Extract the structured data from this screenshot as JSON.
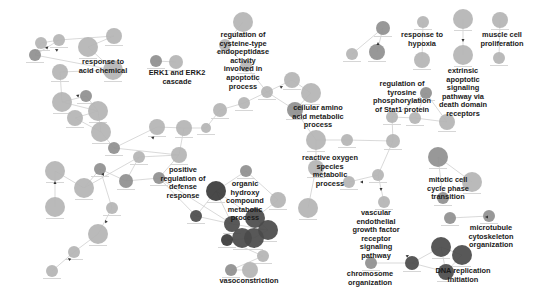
{
  "diagram": {
    "title": "",
    "colors": {
      "node_light": "#b4b4b4",
      "node_mid": "#8f8f8f",
      "node_dark": "#4a4a4a",
      "node_darker": "#3a3a3a",
      "edge": "#cfcfcf",
      "label": "#1a1a1a"
    },
    "cluster_labels": [
      {
        "id": "c1",
        "lines": [
          "response to",
          "acid chemical"
        ],
        "x": 103,
        "y": 64
      },
      {
        "id": "c2",
        "lines": [
          "ERK1 and ERK2",
          "cascade"
        ],
        "x": 177,
        "y": 75
      },
      {
        "id": "c3",
        "lines": [
          "regulation of",
          "cysteine-type",
          "endopeptidase",
          "activity",
          "involved in",
          "apoptotic",
          "process"
        ],
        "x": 243,
        "y": 37
      },
      {
        "id": "c4",
        "lines": [
          "cellular amino",
          "acid metabolic",
          "process"
        ],
        "x": 318,
        "y": 110
      },
      {
        "id": "c5",
        "lines": [
          "regulation of",
          "tyrosine",
          "phosphorylation",
          "of Stat1 protein"
        ],
        "x": 402,
        "y": 86
      },
      {
        "id": "c6",
        "lines": [
          "response to",
          "hypoxia"
        ],
        "x": 422,
        "y": 37
      },
      {
        "id": "c7",
        "lines": [
          "muscle cell",
          "proliferation"
        ],
        "x": 502,
        "y": 37
      },
      {
        "id": "c8",
        "lines": [
          "extrinsic",
          "apoptotic",
          "signaling",
          "pathway via",
          "death domain",
          "receptors"
        ],
        "x": 463,
        "y": 73
      },
      {
        "id": "c9",
        "lines": [
          "positive",
          "regulation of",
          "defense",
          "response"
        ],
        "x": 183,
        "y": 172
      },
      {
        "id": "c10",
        "lines": [
          "organic",
          "hydroxy",
          "compound",
          "metabolic",
          "process"
        ],
        "x": 245,
        "y": 186
      },
      {
        "id": "c11",
        "lines": [
          "reactive oxygen",
          "species",
          "metabolic",
          "process"
        ],
        "x": 330,
        "y": 160
      },
      {
        "id": "c12",
        "lines": [
          "mitotic cell",
          "cycle phase",
          "transition"
        ],
        "x": 448,
        "y": 182
      },
      {
        "id": "c13",
        "lines": [
          "vascular",
          "endothelial",
          "growth factor",
          "receptor",
          "signaling",
          "pathway"
        ],
        "x": 376,
        "y": 215
      },
      {
        "id": "c14",
        "lines": [
          "microtubule",
          "cytoskeleton",
          "organization"
        ],
        "x": 491,
        "y": 230
      },
      {
        "id": "c15",
        "lines": [
          "chromosome",
          "organization"
        ],
        "x": 370,
        "y": 276
      },
      {
        "id": "c16",
        "lines": [
          "DNA replication",
          "initiation"
        ],
        "x": 463,
        "y": 273
      },
      {
        "id": "c17",
        "lines": [
          "vasoconstriction"
        ],
        "x": 249,
        "y": 283
      }
    ],
    "nodes": [
      {
        "x": 41,
        "y": 43,
        "r": 6,
        "tone": "light"
      },
      {
        "x": 59,
        "y": 40,
        "r": 6,
        "tone": "light"
      },
      {
        "x": 35,
        "y": 55,
        "r": 6,
        "tone": "mid"
      },
      {
        "x": 88,
        "y": 47,
        "r": 10,
        "tone": "light"
      },
      {
        "x": 114,
        "y": 36,
        "r": 8,
        "tone": "light"
      },
      {
        "x": 113,
        "y": 70,
        "r": 10,
        "tone": "light"
      },
      {
        "x": 60,
        "y": 72,
        "r": 8,
        "tone": "light"
      },
      {
        "x": 62,
        "y": 102,
        "r": 10,
        "tone": "light"
      },
      {
        "x": 86,
        "y": 96,
        "r": 6,
        "tone": "mid"
      },
      {
        "x": 98,
        "y": 111,
        "r": 10,
        "tone": "light"
      },
      {
        "x": 75,
        "y": 118,
        "r": 8,
        "tone": "light"
      },
      {
        "x": 101,
        "y": 132,
        "r": 10,
        "tone": "light"
      },
      {
        "x": 114,
        "y": 148,
        "r": 6,
        "tone": "mid"
      },
      {
        "x": 157,
        "y": 127,
        "r": 8,
        "tone": "light"
      },
      {
        "x": 156,
        "y": 61,
        "r": 6,
        "tone": "mid"
      },
      {
        "x": 176,
        "y": 62,
        "r": 7,
        "tone": "light"
      },
      {
        "x": 243,
        "y": 22,
        "r": 10,
        "tone": "light"
      },
      {
        "x": 225,
        "y": 45,
        "r": 6,
        "tone": "light"
      },
      {
        "x": 246,
        "y": 66,
        "r": 6,
        "tone": "light"
      },
      {
        "x": 267,
        "y": 92,
        "r": 6,
        "tone": "light"
      },
      {
        "x": 244,
        "y": 103,
        "r": 6,
        "tone": "light"
      },
      {
        "x": 220,
        "y": 110,
        "r": 7,
        "tone": "light"
      },
      {
        "x": 206,
        "y": 128,
        "r": 5,
        "tone": "light"
      },
      {
        "x": 184,
        "y": 128,
        "r": 8,
        "tone": "light"
      },
      {
        "x": 179,
        "y": 155,
        "r": 8,
        "tone": "light"
      },
      {
        "x": 292,
        "y": 80,
        "r": 8,
        "tone": "light"
      },
      {
        "x": 311,
        "y": 93,
        "r": 10,
        "tone": "light"
      },
      {
        "x": 295,
        "y": 110,
        "r": 8,
        "tone": "mid"
      },
      {
        "x": 316,
        "y": 140,
        "r": 10,
        "tone": "light"
      },
      {
        "x": 347,
        "y": 140,
        "r": 6,
        "tone": "light"
      },
      {
        "x": 352,
        "y": 54,
        "r": 6,
        "tone": "light"
      },
      {
        "x": 383,
        "y": 28,
        "r": 7,
        "tone": "mid"
      },
      {
        "x": 377,
        "y": 52,
        "r": 8,
        "tone": "mid"
      },
      {
        "x": 423,
        "y": 22,
        "r": 6,
        "tone": "light"
      },
      {
        "x": 422,
        "y": 60,
        "r": 8,
        "tone": "light"
      },
      {
        "x": 463,
        "y": 19,
        "r": 10,
        "tone": "light"
      },
      {
        "x": 463,
        "y": 55,
        "r": 10,
        "tone": "light"
      },
      {
        "x": 500,
        "y": 20,
        "r": 8,
        "tone": "light"
      },
      {
        "x": 499,
        "y": 58,
        "r": 6,
        "tone": "light"
      },
      {
        "x": 426,
        "y": 93,
        "r": 6,
        "tone": "mid"
      },
      {
        "x": 392,
        "y": 117,
        "r": 6,
        "tone": "light"
      },
      {
        "x": 415,
        "y": 118,
        "r": 6,
        "tone": "light"
      },
      {
        "x": 447,
        "y": 122,
        "r": 8,
        "tone": "light"
      },
      {
        "x": 393,
        "y": 141,
        "r": 7,
        "tone": "light"
      },
      {
        "x": 393,
        "y": 143,
        "r": 0,
        "tone": "light"
      },
      {
        "x": 378,
        "y": 175,
        "r": 6,
        "tone": "light"
      },
      {
        "x": 349,
        "y": 182,
        "r": 6,
        "tone": "light"
      },
      {
        "x": 393,
        "y": 142,
        "r": 0,
        "tone": "light"
      },
      {
        "x": 316,
        "y": 168,
        "r": 8,
        "tone": "light"
      },
      {
        "x": 308,
        "y": 208,
        "r": 10,
        "tone": "light"
      },
      {
        "x": 384,
        "y": 202,
        "r": 6,
        "tone": "light"
      },
      {
        "x": 438,
        "y": 157,
        "r": 10,
        "tone": "mid"
      },
      {
        "x": 472,
        "y": 182,
        "r": 10,
        "tone": "light"
      },
      {
        "x": 443,
        "y": 198,
        "r": 6,
        "tone": "mid"
      },
      {
        "x": 450,
        "y": 218,
        "r": 6,
        "tone": "mid"
      },
      {
        "x": 489,
        "y": 216,
        "r": 6,
        "tone": "mid"
      },
      {
        "x": 441,
        "y": 247,
        "r": 10,
        "tone": "dark"
      },
      {
        "x": 462,
        "y": 255,
        "r": 10,
        "tone": "dark"
      },
      {
        "x": 446,
        "y": 272,
        "r": 8,
        "tone": "dark"
      },
      {
        "x": 412,
        "y": 263,
        "r": 7,
        "tone": "dark"
      },
      {
        "x": 371,
        "y": 263,
        "r": 6,
        "tone": "mid"
      },
      {
        "x": 55,
        "y": 171,
        "r": 10,
        "tone": "light"
      },
      {
        "x": 55,
        "y": 207,
        "r": 10,
        "tone": "light"
      },
      {
        "x": 84,
        "y": 188,
        "r": 10,
        "tone": "light"
      },
      {
        "x": 100,
        "y": 169,
        "r": 6,
        "tone": "mid"
      },
      {
        "x": 126,
        "y": 181,
        "r": 7,
        "tone": "mid"
      },
      {
        "x": 139,
        "y": 157,
        "r": 6,
        "tone": "light"
      },
      {
        "x": 112,
        "y": 208,
        "r": 6,
        "tone": "light"
      },
      {
        "x": 98,
        "y": 234,
        "r": 10,
        "tone": "light"
      },
      {
        "x": 74,
        "y": 252,
        "r": 6,
        "tone": "light"
      },
      {
        "x": 52,
        "y": 271,
        "r": 6,
        "tone": "light"
      },
      {
        "x": 159,
        "y": 178,
        "r": 6,
        "tone": "mid"
      },
      {
        "x": 246,
        "y": 171,
        "r": 6,
        "tone": "mid"
      },
      {
        "x": 216,
        "y": 191,
        "r": 10,
        "tone": "darker"
      },
      {
        "x": 278,
        "y": 200,
        "r": 8,
        "tone": "light"
      },
      {
        "x": 196,
        "y": 216,
        "r": 6,
        "tone": "dark"
      },
      {
        "x": 232,
        "y": 224,
        "r": 8,
        "tone": "dark"
      },
      {
        "x": 255,
        "y": 218,
        "r": 10,
        "tone": "dark"
      },
      {
        "x": 268,
        "y": 230,
        "r": 10,
        "tone": "dark"
      },
      {
        "x": 242,
        "y": 238,
        "r": 10,
        "tone": "dark"
      },
      {
        "x": 254,
        "y": 238,
        "r": 10,
        "tone": "dark"
      },
      {
        "x": 227,
        "y": 240,
        "r": 6,
        "tone": "darker"
      },
      {
        "x": 263,
        "y": 256,
        "r": 6,
        "tone": "light"
      },
      {
        "x": 231,
        "y": 270,
        "r": 6,
        "tone": "mid"
      },
      {
        "x": 250,
        "y": 270,
        "r": 8,
        "tone": "light"
      }
    ],
    "edges": [
      [
        0,
        1
      ],
      [
        1,
        2
      ],
      [
        2,
        5
      ],
      [
        0,
        2
      ],
      [
        1,
        4
      ],
      [
        3,
        4
      ],
      [
        3,
        5
      ],
      [
        5,
        6
      ],
      [
        6,
        7
      ],
      [
        7,
        8
      ],
      [
        8,
        9
      ],
      [
        9,
        10
      ],
      [
        9,
        11
      ],
      [
        10,
        11
      ],
      [
        11,
        12
      ],
      [
        12,
        13
      ],
      [
        7,
        9
      ],
      [
        14,
        15
      ],
      [
        16,
        17
      ],
      [
        17,
        18
      ],
      [
        18,
        19
      ],
      [
        19,
        20
      ],
      [
        20,
        21
      ],
      [
        21,
        22
      ],
      [
        22,
        23
      ],
      [
        23,
        24
      ],
      [
        13,
        23
      ],
      [
        24,
        12
      ],
      [
        19,
        25
      ],
      [
        25,
        26
      ],
      [
        26,
        27
      ],
      [
        19,
        27
      ],
      [
        27,
        28
      ],
      [
        28,
        29
      ],
      [
        29,
        43
      ],
      [
        30,
        31
      ],
      [
        31,
        32
      ],
      [
        33,
        34
      ],
      [
        35,
        36
      ],
      [
        37,
        38
      ],
      [
        39,
        40
      ],
      [
        39,
        41
      ],
      [
        40,
        41
      ],
      [
        41,
        42
      ],
      [
        39,
        42
      ],
      [
        40,
        43
      ],
      [
        43,
        45
      ],
      [
        45,
        46
      ],
      [
        45,
        50
      ],
      [
        28,
        48
      ],
      [
        48,
        49
      ],
      [
        51,
        52
      ],
      [
        51,
        53
      ],
      [
        54,
        55
      ],
      [
        56,
        57
      ],
      [
        57,
        58
      ],
      [
        56,
        58
      ],
      [
        59,
        56
      ],
      [
        59,
        60
      ],
      [
        59,
        58
      ],
      [
        61,
        62
      ],
      [
        61,
        63
      ],
      [
        63,
        64
      ],
      [
        64,
        65
      ],
      [
        65,
        66
      ],
      [
        63,
        66
      ],
      [
        64,
        67
      ],
      [
        67,
        68
      ],
      [
        68,
        69
      ],
      [
        69,
        70
      ],
      [
        65,
        71
      ],
      [
        66,
        24
      ],
      [
        71,
        24
      ],
      [
        72,
        73
      ],
      [
        73,
        75
      ],
      [
        73,
        76
      ],
      [
        73,
        77
      ],
      [
        74,
        77
      ],
      [
        75,
        76
      ],
      [
        76,
        78
      ],
      [
        77,
        78
      ],
      [
        78,
        80
      ],
      [
        80,
        81
      ],
      [
        81,
        82
      ],
      [
        82,
        83
      ],
      [
        83,
        84
      ],
      [
        71,
        75
      ],
      [
        71,
        76
      ],
      [
        72,
        74
      ]
    ],
    "arrows": [
      {
        "x": 45,
        "y": 47,
        "angle": 200
      },
      {
        "x": 55,
        "y": 49,
        "angle": 210
      },
      {
        "x": 76,
        "y": 95,
        "angle": 200
      },
      {
        "x": 55,
        "y": 181,
        "angle": 270
      },
      {
        "x": 104,
        "y": 176,
        "angle": 60
      },
      {
        "x": 68,
        "y": 258,
        "angle": 220
      },
      {
        "x": 105,
        "y": 220,
        "angle": 240
      },
      {
        "x": 151,
        "y": 137,
        "angle": 200
      },
      {
        "x": 283,
        "y": 86,
        "angle": 330
      },
      {
        "x": 378,
        "y": 42,
        "angle": 270
      },
      {
        "x": 463,
        "y": 42,
        "angle": 90
      },
      {
        "x": 485,
        "y": 217,
        "angle": 180
      },
      {
        "x": 360,
        "y": 182,
        "angle": 180
      },
      {
        "x": 381,
        "y": 191,
        "angle": 90
      },
      {
        "x": 409,
        "y": 255,
        "angle": 330
      }
    ]
  }
}
